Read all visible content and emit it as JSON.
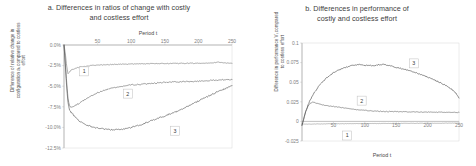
{
  "figure": {
    "panels": [
      {
        "id": "a",
        "title_line1": "a. Differences in ratios of change with costly",
        "title_line2": "and costless effort",
        "xlabel": "Period t",
        "ylabel": "Difference of relative change in configuration aₜ compared to costless effort",
        "xticks": [
          "50",
          "100",
          "150",
          "200",
          "250"
        ],
        "yticks": [
          "0.0%",
          "-2.5%",
          "-5.0%",
          "-7.5%",
          "-10.0%",
          "-12.5%"
        ],
        "series_labels": [
          "1",
          "2",
          "3"
        ]
      },
      {
        "id": "b",
        "title_line1": "b. Differences in performance of",
        "title_line2": "costly and costless effort",
        "xlabel": "Period t",
        "ylabel": "Difference in performance Vₜ compared to costless effort",
        "xticks": [
          "50",
          "100",
          "150",
          "200",
          "250"
        ],
        "yticks": [
          "0.1",
          "0.075",
          "0.05",
          "0.025",
          "0",
          "-0.025"
        ],
        "series_labels": [
          "1",
          "2",
          "3"
        ]
      }
    ]
  },
  "chart_data": [
    {
      "type": "line",
      "panel": "a",
      "title": "a. Differences in ratios of change with costly and costless effort",
      "xlabel": "Period t",
      "ylabel": "Difference of relative change in configuration aₜ compared to costless effort",
      "xlim": [
        0,
        250
      ],
      "ylim": [
        -12.5,
        0.0
      ],
      "xticks": [
        50,
        100,
        150,
        200,
        250
      ],
      "yticks": [
        0.0,
        -2.5,
        -5.0,
        -7.5,
        -10.0,
        -12.5
      ],
      "yunit": "percent",
      "grid": false,
      "legend": "inline-boxed-labels",
      "xaxis_position": "top",
      "series": [
        {
          "name": "1",
          "color": "#808080",
          "x": [
            0,
            2,
            4,
            6,
            8,
            10,
            13,
            16,
            20,
            25,
            30,
            40,
            50,
            60,
            70,
            80,
            90,
            100,
            110,
            120,
            130,
            140,
            150,
            160,
            170,
            180,
            190,
            200,
            210,
            220,
            230,
            240,
            250
          ],
          "y": [
            0.0,
            -1.0,
            -2.6,
            -3.5,
            -3.3,
            -3.1,
            -2.95,
            -2.85,
            -2.75,
            -2.65,
            -2.6,
            -2.5,
            -2.45,
            -2.4,
            -2.38,
            -2.35,
            -2.33,
            -2.3,
            -2.3,
            -2.28,
            -2.27,
            -2.26,
            -2.25,
            -2.25,
            -2.24,
            -2.23,
            -2.22,
            -2.22,
            -2.2,
            -2.15,
            -2.1,
            -2.2,
            -2.2
          ]
        },
        {
          "name": "2",
          "color": "#6e6e6e",
          "x": [
            0,
            2,
            4,
            6,
            8,
            10,
            14,
            18,
            22,
            28,
            34,
            40,
            50,
            60,
            70,
            80,
            90,
            100,
            110,
            120,
            130,
            140,
            150,
            160,
            170,
            180,
            190,
            200,
            210,
            220,
            230,
            240,
            250
          ],
          "y": [
            0.0,
            -2.2,
            -4.6,
            -6.5,
            -7.3,
            -7.6,
            -7.5,
            -7.3,
            -7.1,
            -6.8,
            -6.5,
            -6.2,
            -5.8,
            -5.5,
            -5.25,
            -5.1,
            -4.95,
            -4.85,
            -4.8,
            -4.72,
            -4.65,
            -4.6,
            -4.55,
            -4.5,
            -4.48,
            -4.45,
            -4.42,
            -4.4,
            -4.35,
            -4.3,
            -4.25,
            -4.2,
            -4.2
          ]
        },
        {
          "name": "3",
          "color": "#5a5a5a",
          "x": [
            0,
            2,
            4,
            6,
            8,
            10,
            14,
            18,
            24,
            30,
            40,
            50,
            60,
            70,
            80,
            90,
            100,
            110,
            120,
            130,
            140,
            150,
            160,
            170,
            180,
            190,
            200,
            210,
            220,
            230,
            240,
            250
          ],
          "y": [
            0.0,
            -2.5,
            -5.2,
            -7.0,
            -7.8,
            -8.1,
            -8.5,
            -8.9,
            -9.3,
            -9.6,
            -9.9,
            -10.1,
            -10.2,
            -10.3,
            -10.25,
            -10.2,
            -10.0,
            -9.8,
            -9.5,
            -9.2,
            -8.9,
            -8.6,
            -8.3,
            -8.0,
            -7.6,
            -7.2,
            -6.8,
            -6.4,
            -6.0,
            -5.6,
            -5.3,
            -4.9
          ]
        }
      ],
      "annotations": [
        {
          "label": "1",
          "x": 30,
          "y": -3.2
        },
        {
          "label": "2",
          "x": 95,
          "y": -5.9
        },
        {
          "label": "3",
          "x": 165,
          "y": -10.4
        }
      ]
    },
    {
      "type": "line",
      "panel": "b",
      "title": "b. Differences in performance of costly and costless effort",
      "xlabel": "Period t",
      "ylabel": "Difference in performance Vₜ compared to costless effort",
      "xlim": [
        0,
        250
      ],
      "ylim": [
        -0.025,
        0.1
      ],
      "xticks": [
        50,
        100,
        150,
        200,
        250
      ],
      "yticks": [
        0.1,
        0.075,
        0.05,
        0.025,
        0,
        -0.025
      ],
      "grid": false,
      "legend": "inline-boxed-labels",
      "xaxis_position": "zero-line",
      "series": [
        {
          "name": "1",
          "color": "#9a9a9a",
          "x": [
            0,
            5,
            10,
            20,
            30,
            50,
            75,
            100,
            125,
            150,
            175,
            200,
            225,
            250
          ],
          "y": [
            -0.003,
            -0.0035,
            -0.0035,
            -0.0033,
            -0.0032,
            -0.003,
            -0.0029,
            -0.0028,
            -0.0027,
            -0.0026,
            -0.0025,
            -0.0024,
            -0.0023,
            -0.0022
          ]
        },
        {
          "name": "2",
          "color": "#6e6e6e",
          "x": [
            0,
            3,
            6,
            10,
            14,
            18,
            22,
            26,
            30,
            36,
            42,
            50,
            60,
            70,
            80,
            90,
            100,
            110,
            120,
            135,
            150,
            165,
            180,
            195,
            210,
            225,
            240,
            250
          ],
          "y": [
            -0.005,
            0.004,
            0.013,
            0.02,
            0.0235,
            0.0245,
            0.0235,
            0.0225,
            0.0215,
            0.0205,
            0.0198,
            0.019,
            0.018,
            0.0168,
            0.0158,
            0.0148,
            0.014,
            0.0135,
            0.013,
            0.0126,
            0.0124,
            0.0122,
            0.012,
            0.0119,
            0.0118,
            0.0117,
            0.0116,
            0.0115
          ]
        },
        {
          "name": "3",
          "color": "#4f4f4f",
          "x": [
            0,
            3,
            6,
            10,
            15,
            20,
            26,
            32,
            40,
            50,
            60,
            70,
            80,
            90,
            100,
            110,
            120,
            130,
            140,
            150,
            160,
            170,
            180,
            190,
            200,
            210,
            220,
            230,
            240,
            245,
            250
          ],
          "y": [
            -0.005,
            0.004,
            0.013,
            0.022,
            0.03,
            0.037,
            0.044,
            0.05,
            0.056,
            0.062,
            0.066,
            0.069,
            0.0715,
            0.0725,
            0.0715,
            0.071,
            0.072,
            0.0725,
            0.071,
            0.069,
            0.067,
            0.065,
            0.0625,
            0.0595,
            0.0565,
            0.053,
            0.0495,
            0.0455,
            0.04,
            0.036,
            0.03
          ]
        }
      ],
      "annotations": [
        {
          "label": "3",
          "x": 178,
          "y": 0.074
        },
        {
          "label": "2",
          "x": 95,
          "y": 0.0265
        },
        {
          "label": "1",
          "x": 72,
          "y": -0.018
        }
      ]
    }
  ]
}
